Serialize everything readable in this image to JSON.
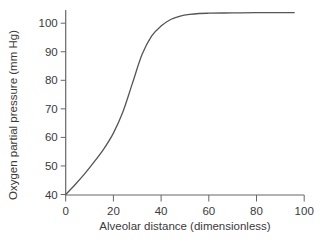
{
  "chart_data": {
    "type": "line",
    "title": "",
    "xlabel": "Alveolar distance (dimensionless)",
    "ylabel": "Oxygen partial pressure (mm Hg)",
    "xlim": [
      0,
      100
    ],
    "ylim": [
      40,
      104
    ],
    "xticks": [
      0,
      20,
      40,
      60,
      80,
      100
    ],
    "yticks": [
      40,
      50,
      60,
      70,
      80,
      90,
      100
    ],
    "grid": false,
    "legend": null,
    "series": [
      {
        "name": "Oxygen partial pressure",
        "color": "#555555",
        "x": [
          0,
          4,
          8,
          12,
          16,
          20,
          24,
          28,
          32,
          36,
          40,
          44,
          48,
          52,
          56,
          60,
          70,
          80,
          90,
          96
        ],
        "y": [
          40,
          43.5,
          47.3,
          51.5,
          56,
          61.5,
          69,
          79,
          89,
          95.5,
          99,
          101.3,
          102.5,
          103.1,
          103.4,
          103.5,
          103.6,
          103.7,
          103.7,
          103.7
        ]
      }
    ]
  },
  "axes": {
    "x_label": "Alveolar distance (dimensionless)",
    "y_label": "Oxygen partial pressure (mm Hg)",
    "x_tick_labels": [
      "0",
      "20",
      "40",
      "60",
      "80",
      "100"
    ],
    "y_tick_labels": [
      "40",
      "50",
      "60",
      "70",
      "80",
      "90",
      "100"
    ]
  }
}
